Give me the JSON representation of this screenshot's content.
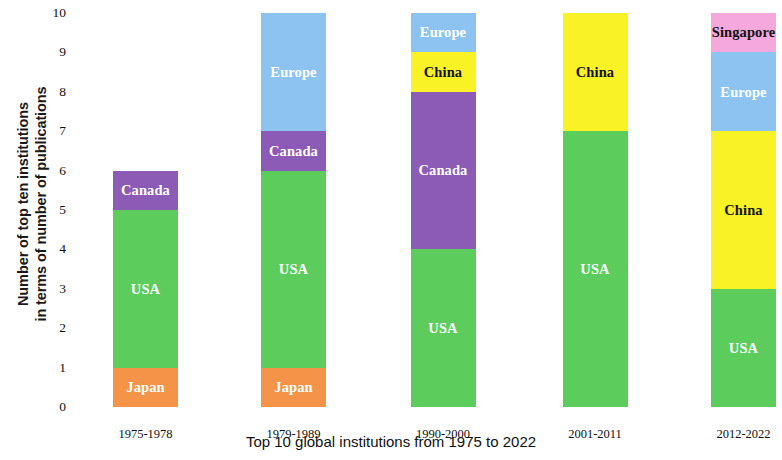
{
  "chart_data": {
    "type": "bar",
    "stacked": true,
    "title": "",
    "xlabel": "Top 10 global institutions from 1975 to 2022",
    "ylabel_line1": "Number of top ten institutions",
    "ylabel_line2": "in terms of number of publications",
    "ylim": [
      0,
      10
    ],
    "ytick_labels": [
      "0",
      "1",
      "2",
      "3",
      "4",
      "5",
      "6",
      "7",
      "8",
      "9",
      "10"
    ],
    "ytick_values": [
      0,
      1,
      2,
      3,
      4,
      5,
      6,
      7,
      8,
      9,
      10
    ],
    "grid": false,
    "legend": "none (segments labeled in place)",
    "categories": [
      "1975-1978",
      "1979-1989",
      "1990-2000",
      "2001-2011",
      "2012-2022"
    ],
    "series": [
      {
        "name": "Japan",
        "color": "#f59348",
        "values": [
          1,
          1,
          0,
          0,
          0
        ]
      },
      {
        "name": "USA",
        "color": "#5ccc5c",
        "values": [
          4,
          5,
          4,
          7,
          3
        ]
      },
      {
        "name": "Canada",
        "color": "#8b5bb5",
        "values": [
          1,
          1,
          4,
          0,
          0
        ]
      },
      {
        "name": "China",
        "color": "#f9f325",
        "values": [
          0,
          0,
          1,
          3,
          4
        ]
      },
      {
        "name": "Europe",
        "color": "#8cc3f0",
        "values": [
          0,
          3,
          1,
          0,
          2
        ]
      },
      {
        "name": "Singapore",
        "color": "#f5a8dc",
        "values": [
          0,
          0,
          0,
          0,
          1
        ]
      }
    ],
    "bars": [
      {
        "category": "1975-1978",
        "total": 6,
        "segments": [
          {
            "label": "Japan",
            "value": 1,
            "color": "#f59348",
            "text_color": "light",
            "show_label": true
          },
          {
            "label": "USA",
            "value": 4,
            "color": "#5ccc5c",
            "text_color": "light",
            "show_label": true
          },
          {
            "label": "Canada",
            "value": 1,
            "color": "#8b5bb5",
            "text_color": "light",
            "show_label": true
          }
        ]
      },
      {
        "category": "1979-1989",
        "total": 10,
        "segments": [
          {
            "label": "Japan",
            "value": 1,
            "color": "#f59348",
            "text_color": "light",
            "show_label": true
          },
          {
            "label": "USA",
            "value": 5,
            "color": "#5ccc5c",
            "text_color": "light",
            "show_label": true
          },
          {
            "label": "Canada",
            "value": 1,
            "color": "#8b5bb5",
            "text_color": "light",
            "show_label": true
          },
          {
            "label": "Europe",
            "value": 3,
            "color": "#8cc3f0",
            "text_color": "light",
            "show_label": true
          }
        ]
      },
      {
        "category": "1990-2000",
        "total": 10,
        "segments": [
          {
            "label": "USA",
            "value": 4,
            "color": "#5ccc5c",
            "text_color": "light",
            "show_label": true
          },
          {
            "label": "Canada",
            "value": 4,
            "color": "#8b5bb5",
            "text_color": "light",
            "show_label": true
          },
          {
            "label": "China",
            "value": 1,
            "color": "#f9f325",
            "text_color": "dark",
            "show_label": true
          },
          {
            "label": "Europe",
            "value": 1,
            "color": "#8cc3f0",
            "text_color": "light",
            "show_label": true
          }
        ]
      },
      {
        "category": "2001-2011",
        "total": 10,
        "segments": [
          {
            "label": "USA",
            "value": 7,
            "color": "#5ccc5c",
            "text_color": "light",
            "show_label": true
          },
          {
            "label": "China",
            "value": 3,
            "color": "#f9f325",
            "text_color": "dark",
            "show_label": true
          }
        ]
      },
      {
        "category": "2012-2022",
        "total": 10,
        "segments": [
          {
            "label": "USA",
            "value": 3,
            "color": "#5ccc5c",
            "text_color": "light",
            "show_label": true
          },
          {
            "label": "China",
            "value": 4,
            "color": "#f9f325",
            "text_color": "dark",
            "show_label": true
          },
          {
            "label": "Europe",
            "value": 2,
            "color": "#8cc3f0",
            "text_color": "light",
            "show_label": true
          },
          {
            "label": "Singapore",
            "value": 1,
            "color": "#f5a8dc",
            "text_color": "dark",
            "show_label": true
          }
        ]
      }
    ]
  },
  "axis": {
    "y_title_line1": "Number of top ten institutions",
    "y_title_line2": "in terms of number of publications",
    "x_title": "Top 10 global institutions from 1975 to 2022"
  }
}
